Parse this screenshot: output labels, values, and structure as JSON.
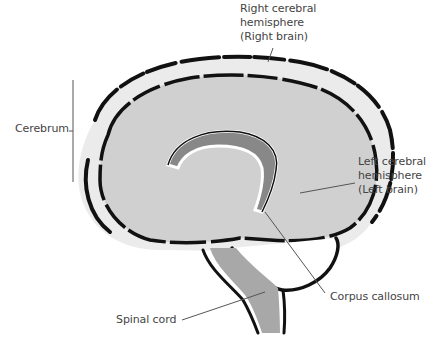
{
  "diagram": {
    "labels": {
      "right_hemisphere": [
        "Right cerebral",
        "hemisphere",
        "(Right brain)"
      ],
      "cerebrum": "Cerebrum",
      "left_hemisphere": [
        "Left cerebral",
        "hemisphere",
        "(Left brain)"
      ],
      "corpus_callosum": "Corpus callosum",
      "spinal_cord": "Spinal cord"
    },
    "colors": {
      "brain_fill": "#d0d0d0",
      "corpus_callosum_fill": "#888888",
      "spinal_cord_fill": "#a8a8a8",
      "outline": "#111111",
      "leader_line": "#555555",
      "text": "#444444"
    }
  }
}
